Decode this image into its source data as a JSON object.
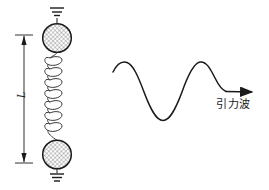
{
  "figure": {
    "background_color": "#ffffff",
    "stroke_color": "#1a1a1a",
    "hatch_color": "#707070",
    "width": 269,
    "height": 190
  },
  "detector": {
    "name": "spring-mass-resonator",
    "top_mass": {
      "label": "",
      "cx": 57,
      "cy": 38,
      "r": 14.5
    },
    "bottom_mass": {
      "label": "",
      "cx": 57,
      "cy": 154.5,
      "r": 14.5
    },
    "spring": {
      "coils": 7,
      "top_y": 53,
      "bottom_y": 140
    },
    "ground_top": {
      "lines": 3,
      "y": 9
    },
    "ground_bottom": {
      "lines": 3,
      "y": 170
    }
  },
  "dimension": {
    "label": "L",
    "name": "length-dimension",
    "x": 24,
    "top_y": 35,
    "bottom_y": 163
  },
  "wave": {
    "label": "引力波",
    "name": "gravitational-wave",
    "start_x": 113,
    "end_x": 231,
    "crest_y": 62,
    "trough_y": 120,
    "baseline_y": 92,
    "arrow_x": 255,
    "arrow_y": 92
  }
}
